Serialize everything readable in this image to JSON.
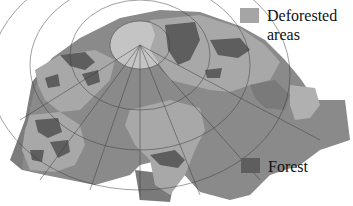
{
  "map": {
    "description": "Interrupted polar-centered world map showing forest and deforested areas",
    "colors": {
      "ocean": "#8a8a8a",
      "land": "#a8a8a8",
      "arctic": "#c4c4c4",
      "forest": "#5e5e5e",
      "deforested": "#a5a5a5",
      "grid": "#3a3a3a",
      "background": "#ffffff"
    }
  },
  "legend": {
    "items": [
      {
        "label": "Deforested areas",
        "line1": "Deforested",
        "line2": "areas",
        "color": "#a5a5a5"
      },
      {
        "label": "Forest",
        "line1": "Forest",
        "color": "#5e5e5e"
      }
    ]
  }
}
